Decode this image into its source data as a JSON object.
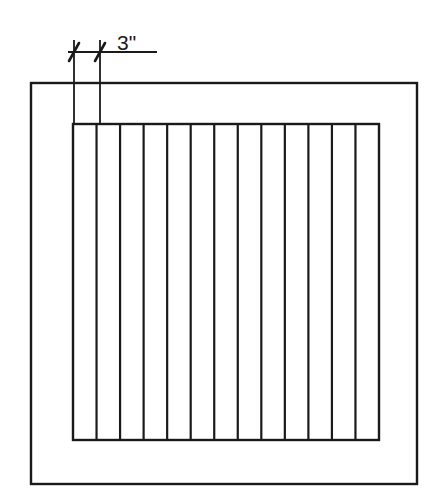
{
  "drawing": {
    "title": "Air return grille elevation detail",
    "background_color": "#ffffff",
    "line_color": "#1a1a1a",
    "canvas": {
      "width": 431,
      "height": 497
    },
    "outer_frame": {
      "name": "grille-outer-frame",
      "x": 31,
      "y": 83,
      "width": 386,
      "height": 401,
      "stroke_width": 2.4
    },
    "grille_panel": {
      "name": "grille-inner-panel",
      "x": 73,
      "y": 124,
      "width": 306,
      "height": 316,
      "stroke_width": 2.4,
      "slat_count": 13,
      "vertical_line_count": 14,
      "slat_pitch": 23.54,
      "slat_stroke_width": 2.2
    },
    "dimension": {
      "name": "slat-width-dimension",
      "label": "3\"",
      "value": 3,
      "units": "inches",
      "label_x": 117,
      "label_y": 50,
      "line_y": 52,
      "line_x1": 68,
      "line_x2": 157,
      "tick_style": "architectural-slash",
      "extension_lines": [
        {
          "x": 74,
          "y1": 40,
          "y2": 126
        },
        {
          "x": 100,
          "y1": 40,
          "y2": 126
        }
      ],
      "ticks": [
        {
          "x": 74,
          "y": 52
        },
        {
          "x": 100,
          "y": 52
        }
      ],
      "stroke_width": 1.8,
      "tick_stroke_width": 2.6
    }
  }
}
